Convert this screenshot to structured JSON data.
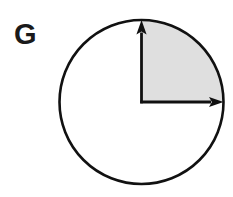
{
  "figure": {
    "label": "G",
    "background_color": "#ffffff",
    "stroke_color": "#111111",
    "shade_color": "#dfdfdf",
    "circle": {
      "center_x": 141.5,
      "center_y": 102,
      "radius": 82,
      "stroke_width": 2.6
    },
    "shaded_sector": {
      "name": "upper-right-quadrant",
      "start_angle_deg": 0,
      "end_angle_deg": 90,
      "sweep_deg": 90,
      "fraction_of_circle": "1/4"
    },
    "arrows": [
      {
        "name": "vertical-radius-arrow",
        "direction": "up",
        "from_x": 141.5,
        "from_y": 102,
        "to_x": 141.5,
        "to_y": 20,
        "angle_deg": 90
      },
      {
        "name": "horizontal-radius-arrow",
        "direction": "right",
        "from_x": 141.5,
        "from_y": 102,
        "to_x": 223.5,
        "to_y": 102,
        "angle_deg": 0
      }
    ]
  },
  "chart_data": {
    "type": "pie",
    "title": "G",
    "xlabel": "",
    "ylabel": "",
    "categories": [
      "shaded sector",
      "unshaded remainder"
    ],
    "values": [
      25,
      75
    ],
    "angles_deg": [
      90,
      270
    ],
    "colors": [
      "#dfdfdf",
      "#ffffff"
    ],
    "legend": "none",
    "grid": false,
    "annotations": [
      "radius arrow pointing up (90 degrees)",
      "radius arrow pointing right (0 degrees)"
    ]
  }
}
